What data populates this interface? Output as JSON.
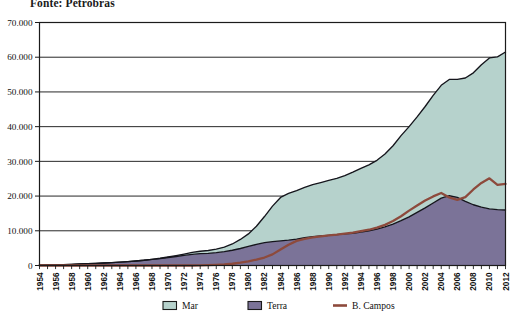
{
  "source_note": "Fonte: Petrobras",
  "legend": {
    "position": "bottom",
    "items": [
      {
        "label": "Mar",
        "type": "area",
        "color": "#b6d2cc",
        "border": "#1b1b1b"
      },
      {
        "label": "Terra",
        "type": "area",
        "color": "#7b7398",
        "border": "#1b1b1b"
      },
      {
        "label": "B. Campos",
        "type": "line",
        "color": "#8d4a3c",
        "border": "#8d4a3c"
      }
    ]
  },
  "axes": {
    "y_label": "",
    "x_label": "",
    "y_ticks": [
      "0",
      "10.000",
      "20.000",
      "30.000",
      "40.000",
      "50.000",
      "60.000",
      "70.000"
    ],
    "x_ticks": [
      "1954",
      "1956",
      "1958",
      "1960",
      "1962",
      "1964",
      "1966",
      "1968",
      "1970",
      "1972",
      "1974",
      "1976",
      "1978",
      "1980",
      "1982",
      "1984",
      "1986",
      "1988",
      "1990",
      "1992",
      "1994",
      "1996",
      "1998",
      "2000",
      "2002",
      "2004",
      "2006",
      "2008",
      "2010",
      "2012"
    ]
  },
  "chart_data": {
    "type": "area",
    "title": "",
    "subtitle": "",
    "xlabel": "",
    "ylabel": "",
    "ylim": [
      0,
      70000
    ],
    "xlim": [
      1954,
      2012
    ],
    "grid": true,
    "stacked": true,
    "legend_position": "bottom",
    "x": [
      1954,
      1955,
      1956,
      1957,
      1958,
      1959,
      1960,
      1961,
      1962,
      1963,
      1964,
      1965,
      1966,
      1967,
      1968,
      1969,
      1970,
      1971,
      1972,
      1973,
      1974,
      1975,
      1976,
      1977,
      1978,
      1979,
      1980,
      1981,
      1982,
      1983,
      1984,
      1985,
      1986,
      1987,
      1988,
      1989,
      1990,
      1991,
      1992,
      1993,
      1994,
      1995,
      1996,
      1997,
      1998,
      1999,
      2000,
      2001,
      2002,
      2003,
      2004,
      2005,
      2006,
      2007,
      2008,
      2009,
      2010,
      2011,
      2012
    ],
    "series": [
      {
        "name": "Terra",
        "color": "#7b7398",
        "stack_order": 1,
        "values": [
          120,
          150,
          200,
          260,
          340,
          430,
          520,
          620,
          720,
          820,
          950,
          1100,
          1300,
          1500,
          1750,
          2000,
          2300,
          2600,
          2900,
          3200,
          3400,
          3500,
          3700,
          4000,
          4400,
          4900,
          5500,
          6100,
          6600,
          6900,
          7100,
          7300,
          7600,
          8000,
          8300,
          8500,
          8700,
          8900,
          9100,
          9300,
          9600,
          10000,
          10500,
          11100,
          11900,
          12900,
          14000,
          15300,
          16600,
          18000,
          19400,
          20100,
          19600,
          18500,
          17500,
          16800,
          16300,
          16100,
          16000
        ]
      },
      {
        "name": "Mar",
        "color": "#b6d2cc",
        "stack_order": 2,
        "values": [
          0,
          0,
          0,
          0,
          0,
          0,
          0,
          0,
          0,
          0,
          0,
          0,
          0,
          0,
          30,
          80,
          150,
          260,
          400,
          560,
          700,
          830,
          1000,
          1300,
          1800,
          2600,
          3600,
          5200,
          7500,
          10200,
          12500,
          13500,
          14000,
          14500,
          15000,
          15400,
          15800,
          16200,
          16800,
          17600,
          18400,
          19000,
          19800,
          21000,
          22600,
          24500,
          26000,
          27500,
          29200,
          31000,
          32500,
          33500,
          34000,
          35500,
          38000,
          41000,
          43500,
          44000,
          45500
        ]
      }
    ],
    "overlay_series": [
      {
        "name": "B. Campos",
        "type": "line",
        "color": "#8d4a3c",
        "values": [
          0,
          0,
          0,
          0,
          0,
          0,
          0,
          0,
          0,
          0,
          0,
          0,
          0,
          0,
          0,
          0,
          0,
          0,
          0,
          0,
          60,
          120,
          200,
          320,
          500,
          800,
          1200,
          1700,
          2300,
          3200,
          4600,
          6000,
          7100,
          7700,
          8100,
          8400,
          8700,
          8900,
          9200,
          9500,
          9900,
          10300,
          10900,
          11700,
          12800,
          14200,
          15800,
          17300,
          18700,
          19900,
          20900,
          19600,
          18900,
          19700,
          21900,
          23800,
          25100,
          23200,
          23500
        ]
      }
    ]
  }
}
